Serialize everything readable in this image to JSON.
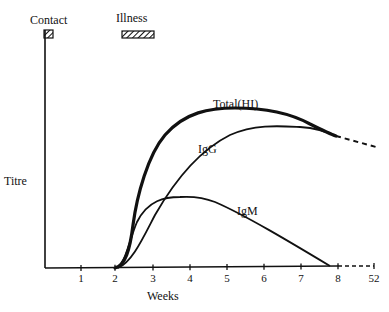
{
  "chart_data": {
    "type": "line",
    "title": "",
    "xlabel": "Weeks",
    "ylabel": "Titre",
    "x_ticks": [
      "1",
      "2",
      "3",
      "4",
      "5",
      "6",
      "7",
      "8",
      "52"
    ],
    "xlim": [
      0,
      52
    ],
    "grid": false,
    "legend": "inline labels",
    "annotations": [
      {
        "label": "Contact",
        "marker": "hatched box",
        "x_range_weeks": [
          0,
          0.25
        ]
      },
      {
        "label": "Illness",
        "marker": "hatched box",
        "x_range_weeks": [
          2.1,
          2.9
        ]
      }
    ],
    "series": [
      {
        "name": "Total(HI)",
        "style": "thick solid",
        "x": [
          2.2,
          2.5,
          2.7,
          3.0,
          3.5,
          4.0,
          4.5,
          5.0,
          5.5,
          6.0,
          6.5,
          7.0,
          7.5,
          8.0,
          52
        ],
        "y": [
          0,
          25,
          50,
          65,
          80,
          89,
          94,
          96,
          97,
          96,
          94,
          91,
          87,
          82,
          76
        ],
        "dashed_after_x": 8
      },
      {
        "name": "IgG",
        "style": "solid",
        "x": [
          2.2,
          2.5,
          3.0,
          3.5,
          4.0,
          4.5,
          5.0,
          5.5,
          6.0,
          6.5,
          7.0,
          7.5,
          8.0
        ],
        "y": [
          0,
          7,
          22,
          38,
          52,
          63,
          72,
          79,
          83,
          85,
          86,
          84,
          82
        ]
      },
      {
        "name": "IgM",
        "style": "solid",
        "x": [
          2.2,
          2.5,
          3.0,
          3.5,
          4.0,
          4.5,
          5.0,
          6.0,
          7.0,
          7.8
        ],
        "y": [
          0,
          22,
          36,
          40,
          40,
          38,
          33,
          22,
          11,
          0
        ]
      }
    ]
  },
  "labels": {
    "contact": "Contact",
    "illness": "Illness",
    "titre": "Titre",
    "weeks": "Weeks",
    "total": "Total(HI)",
    "igg": "IgG",
    "igm": "IgM"
  },
  "ticks": [
    "1",
    "2",
    "3",
    "4",
    "5",
    "6",
    "7",
    "8",
    "52"
  ]
}
